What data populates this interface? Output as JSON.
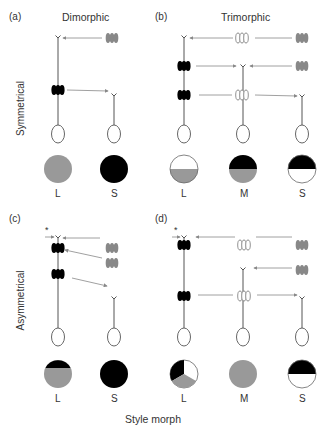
{
  "figure": {
    "panels": {
      "a": {
        "label": "(a)",
        "title": "Dimorphic",
        "morphs": [
          "L",
          "S"
        ]
      },
      "b": {
        "label": "(b)",
        "title": "Trimorphic",
        "morphs": [
          "L",
          "M",
          "S"
        ]
      },
      "c": {
        "label": "(c)",
        "morphs": [
          "L",
          "S"
        ],
        "marker": "*"
      },
      "d": {
        "label": "(d)",
        "morphs": [
          "L",
          "M",
          "S"
        ],
        "marker": "*"
      }
    },
    "row_labels": {
      "top": "Symmetrical",
      "bottom": "Asymmetrical"
    },
    "x_label": "Style morph",
    "legend_colors": {
      "black": "#000000",
      "grey": "#999999",
      "white": "#ffffff",
      "line": "#888888"
    },
    "pie_fills": {
      "a": {
        "L": "grey",
        "S": "black"
      },
      "b": {
        "L": "white top / grey bottom",
        "M": "black top / grey bottom",
        "S": "black top / white bottom"
      },
      "c": {
        "L": "black top / grey bottom",
        "S": "black"
      },
      "d": {
        "L": "thirds: black, white, grey",
        "M": "grey",
        "S": "black top / white bottom"
      }
    }
  }
}
